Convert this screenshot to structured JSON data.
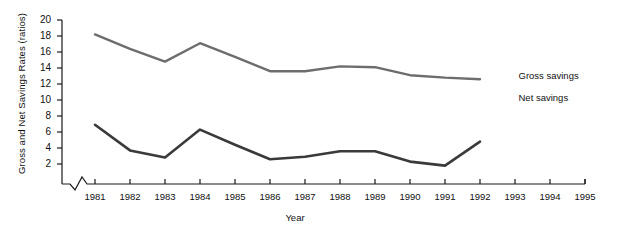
{
  "chart_data": {
    "type": "line",
    "title": "",
    "xlabel": "Year",
    "ylabel": "Gross and Net Savings Rates (ratios)",
    "x": [
      1981,
      1982,
      1983,
      1984,
      1985,
      1986,
      1987,
      1988,
      1989,
      1990,
      1991,
      1992
    ],
    "xtick_labels": [
      "1981",
      "1982",
      "1983",
      "1984",
      "1985",
      "1986",
      "1987",
      "1988",
      "1989",
      "1990",
      "1991",
      "1992",
      "1993",
      "1994",
      "1995"
    ],
    "xlim": [
      1981,
      1995
    ],
    "ytick_labels": [
      "20",
      "18",
      "16",
      "14",
      "12",
      "10",
      "8",
      "6",
      "4",
      "2"
    ],
    "ylim": [
      0,
      20
    ],
    "ytick_values": [
      20,
      18,
      16,
      14,
      12,
      10,
      8,
      6,
      4,
      2
    ],
    "grid": false,
    "axis_break": "x-axis zigzag break before 1981",
    "legend_position": "right-inline",
    "series": [
      {
        "name": "Gross savings",
        "color": "#6d6d6d",
        "values": [
          18.2,
          16.4,
          14.8,
          17.1,
          15.4,
          13.6,
          13.6,
          14.2,
          14.1,
          13.1,
          12.8,
          12.6
        ]
      },
      {
        "name": "Net savings",
        "color": "#3a3a3a",
        "values": [
          6.9,
          3.7,
          2.8,
          6.3,
          4.4,
          2.6,
          2.9,
          3.6,
          3.6,
          2.3,
          1.8,
          4.8
        ]
      }
    ],
    "annotations": [
      {
        "text": "Gross savings",
        "x": 1993.1,
        "y": 13.0
      },
      {
        "text": "Net savings",
        "x": 1993.1,
        "y": 10.2
      }
    ]
  },
  "axis": {
    "color": "#1a1a1a"
  }
}
